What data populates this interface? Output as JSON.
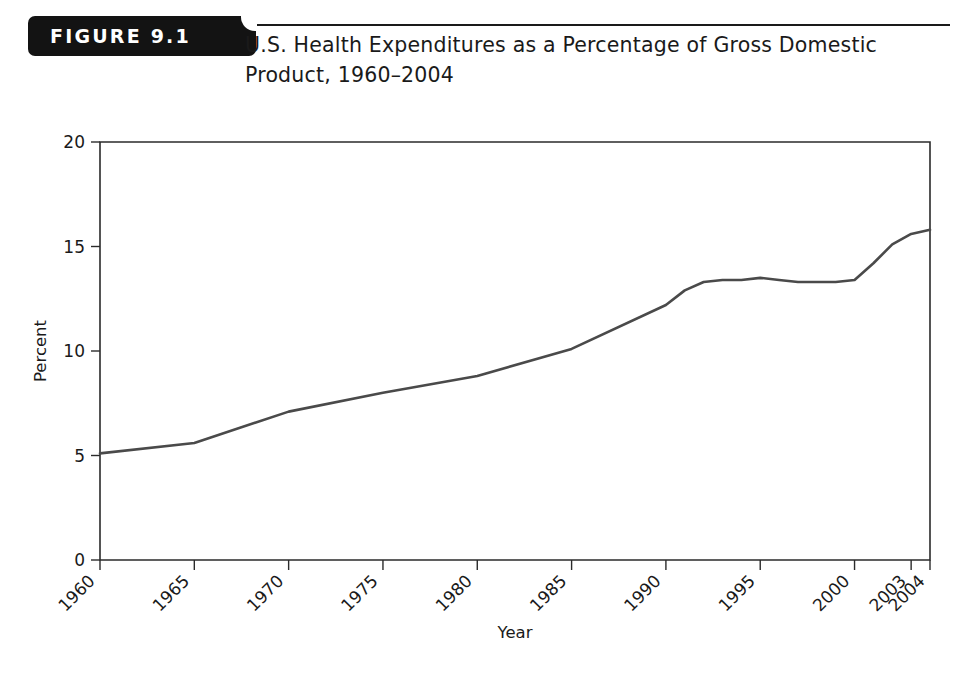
{
  "figure": {
    "tab_label": "FIGURE 9.1",
    "title": "U.S. Health Expenditures as a Percentage of Gross Domestic Product, 1960–2004"
  },
  "chart_data": {
    "type": "line",
    "title": "U.S. Health Expenditures as a Percentage of Gross Domestic Product, 1960–2004",
    "xlabel": "Year",
    "ylabel": "Percent",
    "xlim": [
      1960,
      2004
    ],
    "ylim": [
      0,
      20
    ],
    "yticks": [
      0,
      5,
      10,
      15,
      20
    ],
    "ytick_labels": [
      "0",
      "5",
      "10",
      "15",
      "20"
    ],
    "xticks": [
      1960,
      1965,
      1970,
      1975,
      1980,
      1985,
      1990,
      1995,
      2000,
      2003,
      2004
    ],
    "xtick_labels": [
      "1960",
      "1965",
      "1970",
      "1975",
      "1980",
      "1985",
      "1990",
      "1995",
      "2000",
      "2003",
      "2004"
    ],
    "grid": false,
    "legend": false,
    "line_color": "#4a4a4a",
    "x": [
      1960,
      1965,
      1970,
      1975,
      1980,
      1985,
      1990,
      1991,
      1992,
      1993,
      1994,
      1995,
      1996,
      1997,
      1998,
      1999,
      2000,
      2001,
      2002,
      2003,
      2004
    ],
    "values": [
      5.1,
      5.6,
      7.1,
      8.0,
      8.8,
      10.1,
      12.2,
      12.9,
      13.3,
      13.4,
      13.4,
      13.5,
      13.4,
      13.3,
      13.3,
      13.3,
      13.4,
      14.2,
      15.1,
      15.6,
      15.8
    ],
    "series": [
      {
        "name": "U.S. Health Expenditures (% of GDP)",
        "values": [
          5.1,
          5.6,
          7.1,
          8.0,
          8.8,
          10.1,
          12.2,
          12.9,
          13.3,
          13.4,
          13.4,
          13.5,
          13.4,
          13.3,
          13.3,
          13.3,
          13.4,
          14.2,
          15.1,
          15.6,
          15.8
        ]
      }
    ]
  }
}
